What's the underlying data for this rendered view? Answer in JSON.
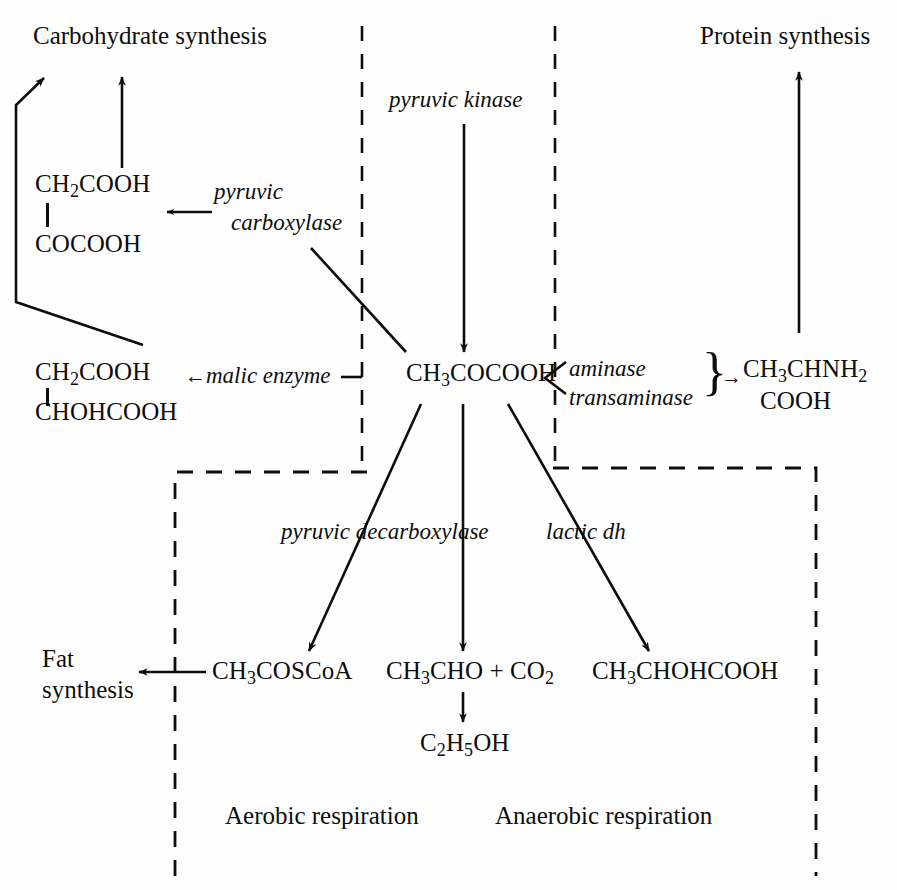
{
  "diagram": {
    "style": {
      "ink": "#0d0d0d",
      "paper": "#fefefe"
    },
    "nodes": {
      "carbohydrate_synthesis": "Carbohydrate   synthesis",
      "protein_synthesis": "Protein synthesis",
      "oxaloacetate_top": "CH",
      "oxaloacetate_top_sub": "2",
      "oxaloacetate_top_rest": "COOH",
      "oxaloacetate_bottom": "COCOOH",
      "malate_top": "CH",
      "malate_top_sub": "2",
      "malate_top_rest": "COOH",
      "malate_bottom": "CHOHCOOH",
      "pyruvate": "CH",
      "pyruvate_sub": "3",
      "pyruvate_rest": "COCOOH",
      "alanine_line1": "CH",
      "alanine_line1_sub": "3",
      "alanine_line1_rest": "CHNH",
      "alanine_line1_sub2": "2",
      "alanine_line2": "COOH",
      "acetyl_coa": "CH",
      "acetyl_coa_sub": "3",
      "acetyl_coa_rest": "COSCoA",
      "acetaldehyde": "CH",
      "acetaldehyde_sub": "3",
      "acetaldehyde_rest": "CHO",
      "plus": "+",
      "carbon_dioxide": "CO",
      "carbon_dioxide_sub": "2",
      "lactate": "CH",
      "lactate_sub": "3",
      "lactate_rest": "CHOHCOOH",
      "ethanol_c": "C",
      "ethanol_c_sub": "2",
      "ethanol_h": "H",
      "ethanol_h_sub": "5",
      "ethanol_oh": "OH",
      "fat_synthesis_line1": "Fat",
      "fat_synthesis_line2": "synthesis"
    },
    "enzymes": {
      "pyruvic_kinase": "pyruvic kinase",
      "pyruvic_carboxylase_line1": "pyruvic",
      "pyruvic_carboxylase_line2": "carboxylase",
      "malic_enzyme": "malic enzyme",
      "aminase": "aminase",
      "transaminase": "transaminase",
      "pyruvic_decarboxylase": "pyruvic decarboxylase",
      "lactic_dh": "lactic dh"
    },
    "regions": {
      "aerobic": "Aerobic respiration",
      "anaerobic": "Anaerobic respiration"
    },
    "glyphs": {
      "left_arrow": "←",
      "right_arrow": "→",
      "brace_right": "}",
      "angle_open": "⟨",
      "dash": "—"
    }
  }
}
